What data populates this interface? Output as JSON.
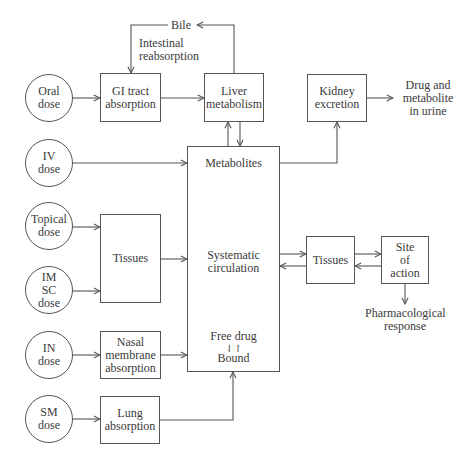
{
  "diagram": {
    "doses": [
      {
        "id": "oral",
        "label": "Oral\ndose"
      },
      {
        "id": "iv",
        "label": "IV\ndose"
      },
      {
        "id": "topical",
        "label": "Topical\ndose"
      },
      {
        "id": "imsc",
        "label": "IM\nSC\ndose"
      },
      {
        "id": "in",
        "label": "IN\ndose"
      },
      {
        "id": "sm",
        "label": "SM\ndose"
      }
    ],
    "boxes": {
      "gi_tract": "GI tract\nabsorption",
      "liver": "Liver\nmetabolism",
      "kidney": "Kidney\nexcretion",
      "tissues_left": "Tissues",
      "nasal": "Nasal\nmembrane\nabsorption",
      "lung": "Lung\nabsorption",
      "tissues_right": "Tissues",
      "site_of_action": "Site\nof\naction"
    },
    "central": {
      "metabolites": "Metabolites",
      "circulation": "Systematic\ncirculation",
      "free_drug": "Free drug",
      "equilibrium_symbol": "⇃↾",
      "bound": "Bound"
    },
    "labels": {
      "bile": "Bile",
      "intestinal_reabsorption": "Intestinal\nreabsorption",
      "urine": "Drug and\nmetabolite\nin urine",
      "response": "Pharmacological\nresponse"
    },
    "edges": [
      {
        "from": "Oral dose",
        "to": "GI tract absorption"
      },
      {
        "from": "GI tract absorption",
        "to": "Liver metabolism"
      },
      {
        "from": "Liver metabolism",
        "to": "Bile"
      },
      {
        "from": "Bile",
        "to": "GI tract absorption",
        "label": "Intestinal reabsorption"
      },
      {
        "from": "Liver metabolism",
        "to": "Systematic circulation",
        "bidirectional": true
      },
      {
        "from": "Metabolites",
        "to": "Kidney excretion"
      },
      {
        "from": "Kidney excretion",
        "to": "Drug and metabolite in urine"
      },
      {
        "from": "IV dose",
        "to": "Systematic circulation"
      },
      {
        "from": "Topical dose",
        "to": "Tissues"
      },
      {
        "from": "IM SC dose",
        "to": "Tissues"
      },
      {
        "from": "Tissues",
        "to": "Systematic circulation"
      },
      {
        "from": "Systematic circulation",
        "to": "Tissues (right)",
        "bidirectional": true
      },
      {
        "from": "Tissues (right)",
        "to": "Site of action",
        "bidirectional": true
      },
      {
        "from": "Site of action",
        "to": "Pharmacological response"
      },
      {
        "from": "IN dose",
        "to": "Nasal membrane absorption"
      },
      {
        "from": "Nasal membrane absorption",
        "to": "Systematic circulation"
      },
      {
        "from": "SM dose",
        "to": "Lung absorption"
      },
      {
        "from": "Lung absorption",
        "to": "Systematic circulation"
      }
    ],
    "colors": {
      "stroke": "#555555",
      "text": "#3a3a3a",
      "background": "#ffffff"
    }
  }
}
